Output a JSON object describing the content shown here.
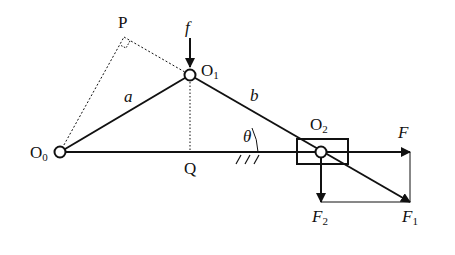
{
  "diagram": {
    "type": "slider-crank mechanism force diagram",
    "points": {
      "O0": {
        "label": "O",
        "sub": "0",
        "x": 60,
        "y": 152
      },
      "O1": {
        "label": "O",
        "sub": "1",
        "x": 190,
        "y": 75
      },
      "O2": {
        "label": "O",
        "sub": "2",
        "x": 321,
        "y": 152
      },
      "P": {
        "label": "P",
        "x": 124,
        "y": 37
      },
      "Q": {
        "label": "Q",
        "x": 190,
        "y": 152
      }
    },
    "links": {
      "a": {
        "label": "a"
      },
      "b": {
        "label": "b"
      }
    },
    "angle": {
      "label": "θ"
    },
    "forces": {
      "f": {
        "label": "f"
      },
      "F": {
        "label": "F"
      },
      "F1": {
        "label": "F",
        "sub": "1"
      },
      "F2": {
        "label": "F",
        "sub": "2"
      }
    },
    "colors": {
      "line": "#111111",
      "background": "#ffffff"
    }
  }
}
